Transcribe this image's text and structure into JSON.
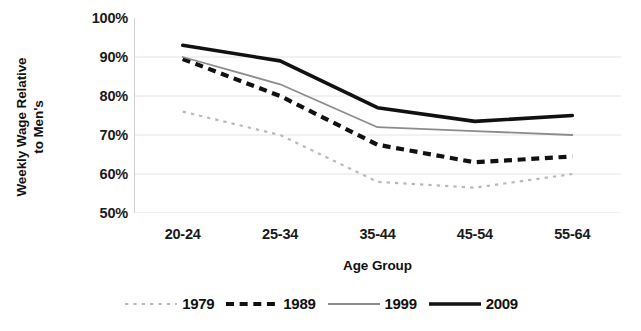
{
  "chart_data": {
    "type": "line",
    "title": "",
    "xlabel": "Age Group",
    "ylabel": "Weekly Wage Relative to Men's",
    "ylabel_line1": "Weekly Wage Relative",
    "ylabel_line2": "to Men's",
    "categories": [
      "20-24",
      "25-34",
      "35-44",
      "45-54",
      "55-64"
    ],
    "ylim": [
      50,
      100
    ],
    "yticks": [
      "50%",
      "60%",
      "70%",
      "80%",
      "90%",
      "100%"
    ],
    "ytick_values": [
      50,
      60,
      70,
      80,
      90,
      100
    ],
    "grid": true,
    "legend_position": "bottom",
    "series": [
      {
        "name": "1979",
        "values": [
          76,
          70,
          58,
          56.5,
          60
        ],
        "style": "dotted",
        "color": "#b9b9b9",
        "width": 2.2
      },
      {
        "name": "1989",
        "values": [
          89.5,
          80,
          67.5,
          63,
          64.5
        ],
        "style": "dashed",
        "color": "#111111",
        "width": 4.2
      },
      {
        "name": "1999",
        "values": [
          90,
          83,
          72,
          71,
          70
        ],
        "style": "solid",
        "color": "#8c8c8c",
        "width": 1.8
      },
      {
        "name": "2009",
        "values": [
          93,
          89,
          77,
          73.5,
          75
        ],
        "style": "solid",
        "color": "#111111",
        "width": 3.6
      }
    ]
  },
  "legend": {
    "items": [
      {
        "label": "1979"
      },
      {
        "label": "1989"
      },
      {
        "label": "1999"
      },
      {
        "label": "2009"
      }
    ]
  }
}
